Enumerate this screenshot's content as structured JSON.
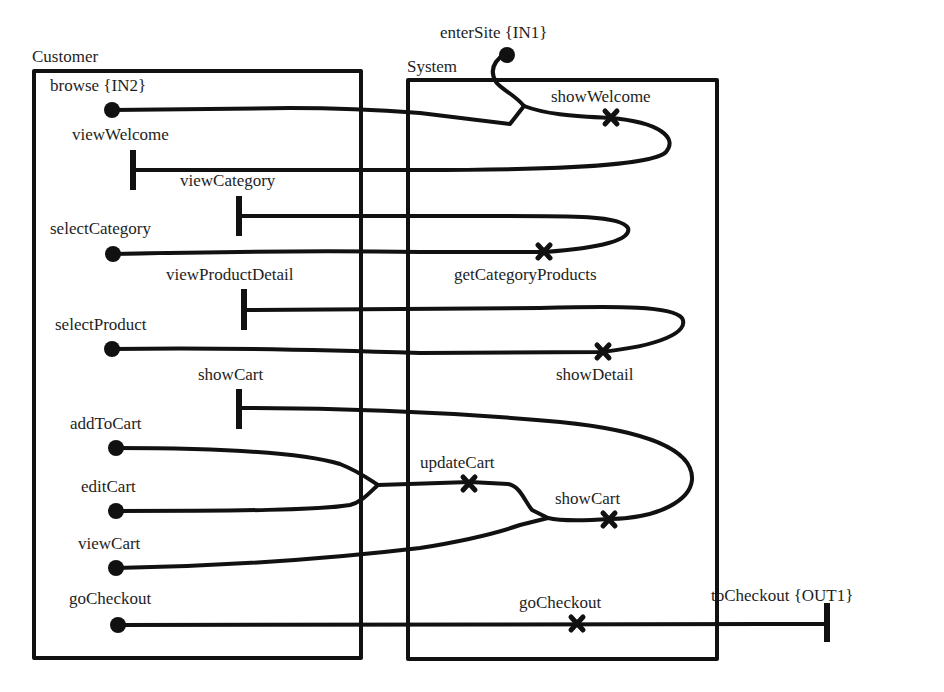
{
  "diagram": {
    "type": "sequence-flow / use case map",
    "colors": {
      "ink": "#111111",
      "background": "#ffffff"
    },
    "components": [
      {
        "id": "customer",
        "label": "Customer"
      },
      {
        "id": "system",
        "label": "System"
      }
    ],
    "start_points": [
      {
        "id": "enterSite",
        "label": "enterSite {IN1}"
      },
      {
        "id": "browse",
        "label": "browse {IN2}"
      },
      {
        "id": "selectCategory",
        "label": "selectCategory"
      },
      {
        "id": "selectProduct",
        "label": "selectProduct"
      },
      {
        "id": "addToCart",
        "label": "addToCart"
      },
      {
        "id": "editCart",
        "label": "editCart"
      },
      {
        "id": "viewCart",
        "label": "viewCart"
      },
      {
        "id": "goCheckout",
        "label": "goCheckout"
      }
    ],
    "end_points": [
      {
        "id": "viewWelcome",
        "label": "viewWelcome"
      },
      {
        "id": "viewCategory",
        "label": "viewCategory"
      },
      {
        "id": "viewProductDetail",
        "label": "viewProductDetail"
      },
      {
        "id": "showCartEnd",
        "label": "showCart"
      },
      {
        "id": "toCheckout",
        "label": "toCheckout {OUT1}"
      }
    ],
    "responsibilities": [
      {
        "id": "showWelcome",
        "label": "showWelcome"
      },
      {
        "id": "getCategoryProducts",
        "label": "getCategoryProducts"
      },
      {
        "id": "showDetail",
        "label": "showDetail"
      },
      {
        "id": "updateCart",
        "label": "updateCart"
      },
      {
        "id": "showCartResp",
        "label": "showCart"
      },
      {
        "id": "goCheckoutResp",
        "label": "goCheckout"
      }
    ],
    "paths": [
      {
        "from": [
          "enterSite",
          "browse"
        ],
        "via": [
          "showWelcome"
        ],
        "to": "viewWelcome"
      },
      {
        "from": [
          "selectCategory"
        ],
        "via": [
          "getCategoryProducts"
        ],
        "to": "viewCategory"
      },
      {
        "from": [
          "selectProduct"
        ],
        "via": [
          "showDetail"
        ],
        "to": "viewProductDetail"
      },
      {
        "from": [
          "addToCart",
          "editCart"
        ],
        "via": [
          "updateCart",
          "showCart"
        ],
        "to": "showCart"
      },
      {
        "from": [
          "viewCart"
        ],
        "via": [
          "showCart"
        ],
        "to": "showCart"
      },
      {
        "from": [
          "goCheckout"
        ],
        "via": [
          "goCheckout"
        ],
        "to": "toCheckout"
      }
    ]
  }
}
